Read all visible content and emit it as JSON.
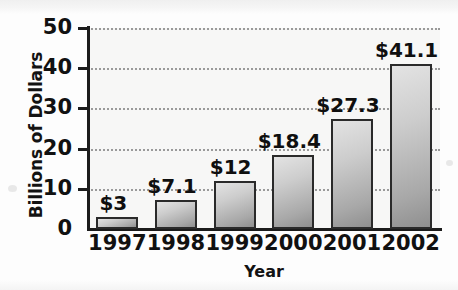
{
  "chart_data": {
    "type": "bar",
    "title": "",
    "xlabel": "Year",
    "ylabel": "Billions of Dollars",
    "categories": [
      "1997",
      "1998",
      "1999",
      "2000",
      "2001",
      "2002"
    ],
    "values": [
      3,
      7.1,
      12,
      18.4,
      27.3,
      41.1
    ],
    "value_labels": [
      "$3",
      "$7.1",
      "$12",
      "$18.4",
      "$27.3",
      "$41.1"
    ],
    "ylim": [
      0,
      50
    ],
    "yticks": [
      0,
      10,
      20,
      30,
      40,
      50
    ],
    "ytick_labels": [
      "0",
      "10",
      "20",
      "30",
      "40",
      "50"
    ],
    "grid": "horizontal-dotted",
    "legend": "none",
    "bar_color": "#b4b4b4",
    "bar_outline_color": "#2a2a2a",
    "plot_background": "#f7f7f6",
    "axis_color": "#1c1c1c",
    "gridline_color": "#9a9a9a"
  }
}
